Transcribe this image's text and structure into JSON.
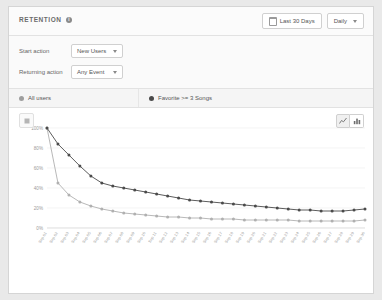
{
  "header": {
    "title": "RETENTION",
    "info_icon": "info-icon",
    "date_range_label": "Last 30 Days",
    "date_range_icon": "calendar-icon",
    "granularity_label": "Daily",
    "granularity_options": [
      "Daily",
      "Weekly",
      "Monthly"
    ]
  },
  "filters": {
    "rows": [
      {
        "label": "Start action",
        "value": "New Users"
      },
      {
        "label": "Returning action",
        "value": "Any Event"
      }
    ]
  },
  "segments": [
    {
      "label": "All users",
      "color": "#9e9e9e"
    },
    {
      "label": "Favorite >= 3 Songs",
      "color": "#4a4a4a"
    }
  ],
  "chart_toolbar": {
    "legend_icon": "chart-thumbnail-icon",
    "line_chart_icon": "line-chart-icon",
    "bar_chart_icon": "bar-chart-icon",
    "active": "line-chart-icon"
  },
  "chart_data": {
    "type": "line",
    "title": "",
    "xlabel": "",
    "ylabel": "",
    "ylim": [
      0,
      100
    ],
    "yticks": [
      0,
      20,
      40,
      60,
      80,
      100
    ],
    "ytick_labels": [
      "0%",
      "20%",
      "40%",
      "60%",
      "80%",
      "100%"
    ],
    "grid": true,
    "legend_position": "segment-bar",
    "x": [
      "Sep 01",
      "Sep 02",
      "Sep 03",
      "Sep 04",
      "Sep 05",
      "Sep 06",
      "Sep 07",
      "Sep 08",
      "Sep 09",
      "Sep 10",
      "Sep 11",
      "Sep 12",
      "Sep 13",
      "Sep 14",
      "Sep 15",
      "Sep 16",
      "Sep 17",
      "Sep 18",
      "Sep 19",
      "Sep 20",
      "Sep 21",
      "Sep 22",
      "Sep 23",
      "Sep 24",
      "Sep 25",
      "Sep 26",
      "Sep 27",
      "Sep 28",
      "Sep 29",
      "Sep 30"
    ],
    "series": [
      {
        "name": "Favorite >= 3 Songs",
        "color": "#4a4a4a",
        "values": [
          100,
          84,
          73,
          62,
          52,
          45,
          42,
          40,
          38,
          36,
          34,
          32,
          30,
          28,
          27,
          26,
          25,
          24,
          23,
          22,
          21,
          20,
          19,
          18,
          18,
          17,
          17,
          17,
          18,
          19
        ]
      },
      {
        "name": "All users",
        "color": "#b0b0b0",
        "values": [
          100,
          45,
          33,
          26,
          22,
          19,
          17,
          15,
          14,
          13,
          12,
          11,
          11,
          10,
          10,
          9,
          9,
          9,
          8,
          8,
          8,
          8,
          8,
          7,
          7,
          7,
          7,
          7,
          7,
          8
        ]
      }
    ]
  }
}
